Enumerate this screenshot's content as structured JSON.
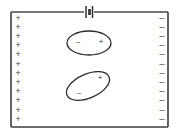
{
  "figure": {
    "background_color": "#ffffff",
    "line_color": "#3c3c3c",
    "glyph_color": "#3a3a3a"
  },
  "frame": {
    "name": "capacitor-region",
    "x": 11,
    "y": 12,
    "width": 157,
    "height": 115
  },
  "circuit": {
    "wire_label": "top-wire",
    "wire_y": 12,
    "wire_x_start": 11,
    "wire_x_end": 168,
    "battery": {
      "name": "battery-symbol",
      "center_x": 89,
      "plate_long_label": "long-plate",
      "plate_short_label": "short-plate"
    }
  },
  "left_plate": {
    "name": "positive-plate",
    "charge_symbol": "+",
    "charge_count": 12,
    "x": 18,
    "y_start": 18,
    "y_step": 9.2,
    "polarity": "positive"
  },
  "right_plate": {
    "name": "negative-plate",
    "charge_symbol": "–",
    "charge_count": 12,
    "x": 162,
    "y_start": 18,
    "y_step": 9.2,
    "polarity": "negative"
  },
  "dipoles": [
    {
      "name": "dipole-aligned",
      "cx": 89,
      "cy": 43,
      "rx": 22,
      "ry": 12,
      "rotation_deg": 0,
      "negative_symbol": "–",
      "negative_x": 78,
      "negative_y": 42,
      "positive_symbol": "+",
      "positive_x": 101,
      "positive_y": 42,
      "orientation": "horizontal, aligned with field"
    },
    {
      "name": "dipole-tilted",
      "cx": 88,
      "cy": 86,
      "rx": 23,
      "ry": 12,
      "rotation_deg": -24,
      "negative_symbol": "–",
      "negative_x": 79,
      "negative_y": 93,
      "positive_symbol": "+",
      "positive_x": 100,
      "positive_y": 78,
      "orientation": "tilted relative to field"
    }
  ]
}
